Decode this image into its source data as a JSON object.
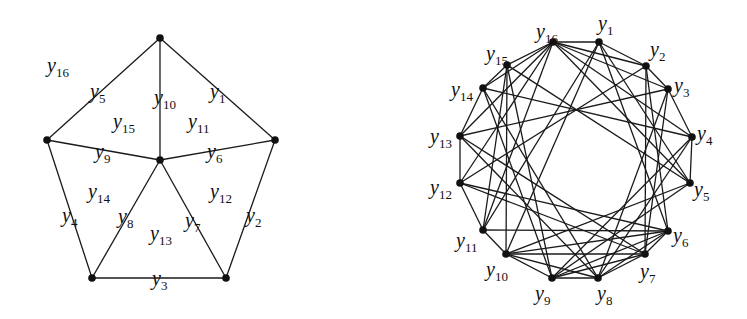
{
  "figure": {
    "left_graph": {
      "title": "Wheel W5 with edges and faces labelled",
      "vertices": {
        "T": [
          160,
          38
        ],
        "R": [
          275,
          140
        ],
        "BR": [
          226,
          278
        ],
        "BL": [
          92,
          278
        ],
        "L": [
          47,
          140
        ],
        "C": [
          160,
          160
        ]
      },
      "edges": [
        {
          "id": "y1",
          "from": "T",
          "to": "R",
          "label_pos": [
            210,
            98
          ]
        },
        {
          "id": "y2",
          "from": "R",
          "to": "BR",
          "label_pos": [
            246,
            222
          ]
        },
        {
          "id": "y3",
          "from": "BR",
          "to": "BL",
          "label_pos": [
            152,
            285
          ]
        },
        {
          "id": "y4",
          "from": "BL",
          "to": "L",
          "label_pos": [
            62,
            222
          ]
        },
        {
          "id": "y5",
          "from": "L",
          "to": "T",
          "label_pos": [
            90,
            98
          ]
        },
        {
          "id": "y6",
          "from": "C",
          "to": "R",
          "label_pos": [
            207,
            158
          ]
        },
        {
          "id": "y7",
          "from": "C",
          "to": "BR",
          "label_pos": [
            185,
            227
          ]
        },
        {
          "id": "y8",
          "from": "C",
          "to": "BL",
          "label_pos": [
            118,
            223
          ]
        },
        {
          "id": "y9",
          "from": "C",
          "to": "L",
          "label_pos": [
            95,
            158
          ]
        },
        {
          "id": "y10",
          "from": "C",
          "to": "T",
          "label_pos": [
            154,
            104
          ]
        }
      ],
      "faces": [
        {
          "id": "y11",
          "label_pos": [
            188,
            128
          ]
        },
        {
          "id": "y12",
          "label_pos": [
            210,
            198
          ]
        },
        {
          "id": "y13",
          "label_pos": [
            150,
            240
          ]
        },
        {
          "id": "y14",
          "label_pos": [
            88,
            198
          ]
        },
        {
          "id": "y15",
          "label_pos": [
            113,
            128
          ]
        },
        {
          "id": "y16",
          "label_pos": [
            47,
            72
          ]
        }
      ]
    },
    "right_graph": {
      "title": "Graph on y1..y16",
      "vertices": [
        {
          "id": "y1",
          "pos": [
            599,
            42
          ],
          "label_pos": [
            598,
            30
          ]
        },
        {
          "id": "y2",
          "pos": [
            646,
            66
          ],
          "label_pos": [
            650,
            56
          ]
        },
        {
          "id": "y3",
          "pos": [
            668,
            89
          ],
          "label_pos": [
            674,
            92
          ]
        },
        {
          "id": "y4",
          "pos": [
            692,
            137
          ],
          "label_pos": [
            697,
            140
          ]
        },
        {
          "id": "y5",
          "pos": [
            690,
            183
          ],
          "label_pos": [
            694,
            196
          ]
        },
        {
          "id": "y6",
          "pos": [
            668,
            231
          ],
          "label_pos": [
            673,
            242
          ]
        },
        {
          "id": "y7",
          "pos": [
            645,
            254
          ],
          "label_pos": [
            640,
            278
          ]
        },
        {
          "id": "y8",
          "pos": [
            598,
            278
          ],
          "label_pos": [
            597,
            300
          ]
        },
        {
          "id": "y9",
          "pos": [
            552,
            278
          ],
          "label_pos": [
            535,
            300
          ]
        },
        {
          "id": "y10",
          "pos": [
            506,
            254
          ],
          "label_pos": [
            486,
            276
          ]
        },
        {
          "id": "y11",
          "pos": [
            483,
            230
          ],
          "label_pos": [
            456,
            247
          ]
        },
        {
          "id": "y12",
          "pos": [
            460,
            183
          ],
          "label_pos": [
            430,
            194
          ]
        },
        {
          "id": "y13",
          "pos": [
            460,
            136
          ],
          "label_pos": [
            430,
            143
          ]
        },
        {
          "id": "y14",
          "pos": [
            483,
            88
          ],
          "label_pos": [
            451,
            96
          ]
        },
        {
          "id": "y15",
          "pos": [
            507,
            65
          ],
          "label_pos": [
            486,
            60
          ]
        },
        {
          "id": "y16",
          "pos": [
            553,
            42
          ],
          "label_pos": [
            536,
            38
          ]
        }
      ],
      "edges": [
        [
          "y1",
          "y2"
        ],
        [
          "y1",
          "y6"
        ],
        [
          "y1",
          "y10"
        ],
        [
          "y1",
          "y5"
        ],
        [
          "y1",
          "y11"
        ],
        [
          "y1",
          "y16"
        ],
        [
          "y2",
          "y3"
        ],
        [
          "y2",
          "y6"
        ],
        [
          "y2",
          "y7"
        ],
        [
          "y2",
          "y12"
        ],
        [
          "y2",
          "y16"
        ],
        [
          "y3",
          "y4"
        ],
        [
          "y3",
          "y7"
        ],
        [
          "y3",
          "y8"
        ],
        [
          "y3",
          "y13"
        ],
        [
          "y3",
          "y16"
        ],
        [
          "y4",
          "y5"
        ],
        [
          "y4",
          "y8"
        ],
        [
          "y4",
          "y9"
        ],
        [
          "y4",
          "y14"
        ],
        [
          "y4",
          "y16"
        ],
        [
          "y5",
          "y9"
        ],
        [
          "y5",
          "y10"
        ],
        [
          "y5",
          "y15"
        ],
        [
          "y5",
          "y16"
        ],
        [
          "y6",
          "y7"
        ],
        [
          "y6",
          "y8"
        ],
        [
          "y6",
          "y9"
        ],
        [
          "y6",
          "y10"
        ],
        [
          "y6",
          "y11"
        ],
        [
          "y6",
          "y12"
        ],
        [
          "y7",
          "y8"
        ],
        [
          "y7",
          "y9"
        ],
        [
          "y7",
          "y10"
        ],
        [
          "y7",
          "y12"
        ],
        [
          "y7",
          "y13"
        ],
        [
          "y8",
          "y9"
        ],
        [
          "y8",
          "y10"
        ],
        [
          "y8",
          "y13"
        ],
        [
          "y8",
          "y14"
        ],
        [
          "y9",
          "y10"
        ],
        [
          "y9",
          "y14"
        ],
        [
          "y9",
          "y15"
        ],
        [
          "y10",
          "y11"
        ],
        [
          "y10",
          "y15"
        ],
        [
          "y11",
          "y12"
        ],
        [
          "y11",
          "y15"
        ],
        [
          "y11",
          "y16"
        ],
        [
          "y12",
          "y13"
        ],
        [
          "y12",
          "y16"
        ],
        [
          "y13",
          "y14"
        ],
        [
          "y13",
          "y16"
        ],
        [
          "y14",
          "y15"
        ],
        [
          "y14",
          "y16"
        ],
        [
          "y15",
          "y16"
        ]
      ]
    }
  }
}
